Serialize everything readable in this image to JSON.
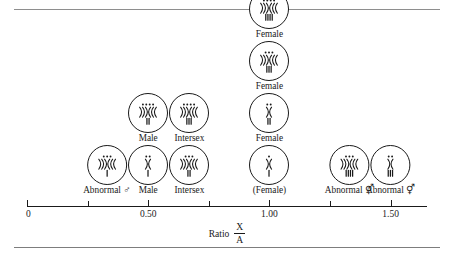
{
  "figure": {
    "kind": "chromosome-ratio-diagram",
    "axis_title_label": "Ratio",
    "axis_title_numerator": "X",
    "axis_title_denominator": "A"
  },
  "chart_data": {
    "type": "scatter",
    "title": "",
    "xlabel": "Ratio X/A",
    "ylabel": "",
    "xlim": [
      0,
      1.65
    ],
    "grid": false,
    "legend": null,
    "x_ticks": [
      {
        "value": 0.0,
        "label": "0",
        "major": true
      },
      {
        "value": 0.25,
        "label": "",
        "major": false
      },
      {
        "value": 0.5,
        "label": "0.50",
        "major": true
      },
      {
        "value": 0.75,
        "label": "",
        "major": false
      },
      {
        "value": 1.0,
        "label": "1.00",
        "major": true
      },
      {
        "value": 1.25,
        "label": "",
        "major": false
      },
      {
        "value": 1.5,
        "label": "1.50",
        "major": true
      }
    ],
    "columns": [
      {
        "x": 0.33,
        "cells": [
          {
            "label": "Abnormal",
            "sex_symbol": "♂",
            "dots": 3,
            "arms": 3,
            "bars": 1,
            "row": 0
          }
        ]
      },
      {
        "x": 0.5,
        "cells": [
          {
            "label": "Male",
            "sex_symbol": "",
            "dots": 2,
            "arms": 1,
            "bars": 1,
            "row": 0
          },
          {
            "label": "Male",
            "sex_symbol": "",
            "dots": 4,
            "arms": 3,
            "bars": 2,
            "row": 1
          }
        ]
      },
      {
        "x": 0.67,
        "cells": [
          {
            "label": "Intersex",
            "sex_symbol": "",
            "dots": 3,
            "arms": 3,
            "bars": 2,
            "row": 0
          },
          {
            "label": "Intersex",
            "sex_symbol": "",
            "dots": 4,
            "arms": 3,
            "bars": 3,
            "row": 1
          }
        ]
      },
      {
        "x": 1.0,
        "cells": [
          {
            "label": "(Female)",
            "sex_symbol": "",
            "dots": 1,
            "arms": 1,
            "bars": 1,
            "row": 0
          },
          {
            "label": "Female",
            "sex_symbol": "",
            "dots": 2,
            "arms": 1,
            "bars": 2,
            "row": 1
          },
          {
            "label": "Female",
            "sex_symbol": "",
            "dots": 3,
            "arms": 3,
            "bars": 3,
            "row": 2
          },
          {
            "label": "Female",
            "sex_symbol": "",
            "dots": 4,
            "arms": 3,
            "bars": 4,
            "row": 3
          }
        ]
      },
      {
        "x": 1.33,
        "cells": [
          {
            "label": "Abnormal",
            "sex_symbol": "⚥",
            "dots": 3,
            "arms": 3,
            "bars": 4,
            "row": 0
          }
        ]
      },
      {
        "x": 1.5,
        "cells": [
          {
            "label": "Abnormal",
            "sex_symbol": "⚥",
            "dots": 2,
            "arms": 1,
            "bars": 3,
            "row": 0
          }
        ]
      }
    ]
  }
}
